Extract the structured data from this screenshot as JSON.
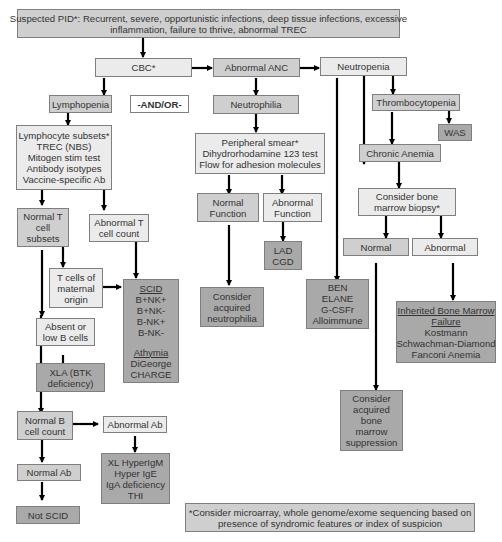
{
  "top": {
    "line1": "Suspected PID*: Recurrent, severe, opportunistic infections, deep tissue infections, excessive",
    "line2": "inflammation, failure to thrive, abnormal TREC"
  },
  "cbc": "CBC*",
  "abnormal_anc": "Abnormal ANC",
  "neutropenia": "Neutropenia",
  "lymphopenia": "Lymphopenia",
  "and_or": "-AND/OR-",
  "neutrophilia": "Neutrophilia",
  "thrombocytopenia": "Thrombocytopenia",
  "was": "WAS",
  "chronic_anemia": "Chronic Anemia",
  "lymph_tests": [
    "Lymphocyte subsets*",
    "TREC (NBS)",
    "Mitogen stim test",
    "Antibody isotypes",
    "Vaccine-specific Ab"
  ],
  "neutro_tests": [
    "Peripheral smear*",
    "Dihydrorhodamine 123 test",
    "Flow for adhesion molecules"
  ],
  "bone_marrow_biopsy": [
    "Consider bone",
    "marrow biopsy*"
  ],
  "normal_t": [
    "Normal T",
    "cell",
    "subsets"
  ],
  "abnormal_t": [
    "Abnormal T",
    "cell count"
  ],
  "normal_function": [
    "Normal",
    "Function"
  ],
  "abnormal_function": [
    "Abnormal",
    "Function"
  ],
  "bm_normal": "Normal",
  "bm_abnormal": "Abnormal",
  "t_maternal": [
    "T cells of",
    "maternal",
    "origin"
  ],
  "lad_cgd": [
    "LAD",
    "CGD"
  ],
  "scid": {
    "heading": "SCID",
    "items": [
      "B+NK+",
      "B+NK-",
      "B-NK+",
      "B-NK-"
    ],
    "heading2": "Athymia",
    "items2": [
      "DiGeorge",
      "CHARGE"
    ]
  },
  "absent_b": [
    "Absent or",
    "low B cells"
  ],
  "acquired_neutrophilia": [
    "Consider",
    "acquired",
    "neutrophilia"
  ],
  "ben": [
    "BEN",
    "ELANE",
    "G-CSFr",
    "Alloimmune"
  ],
  "ibmf": {
    "heading": [
      "Inherited Bone Marrow",
      "Failure"
    ],
    "items": [
      "Kostmann",
      "Schwachman-Diamond",
      "Fanconi Anemia"
    ]
  },
  "xla": [
    "XLA (BTK",
    "deficiency)"
  ],
  "acquired_bm": [
    "Consider",
    "acquired",
    "bone",
    "marrow",
    "suppression"
  ],
  "normal_b": [
    "Normal B",
    "cell count"
  ],
  "abnormal_ab": "Abnormal Ab",
  "normal_ab": "Normal Ab",
  "hyper": [
    "XL HyperIgM",
    "Hyper IgE",
    "IgA deficiency",
    "THI"
  ],
  "not_scid": "Not SCID",
  "footnote": [
    "*Consider microarray, whole genome/exome  sequencing based on",
    "presence of syndromic features or index of suspicion"
  ],
  "colors": {
    "light": "#ebebeb",
    "mid": "#cfcfcf",
    "dark": "#a9a9a9",
    "border": "#7f7f7f",
    "arrow": "#000000"
  }
}
